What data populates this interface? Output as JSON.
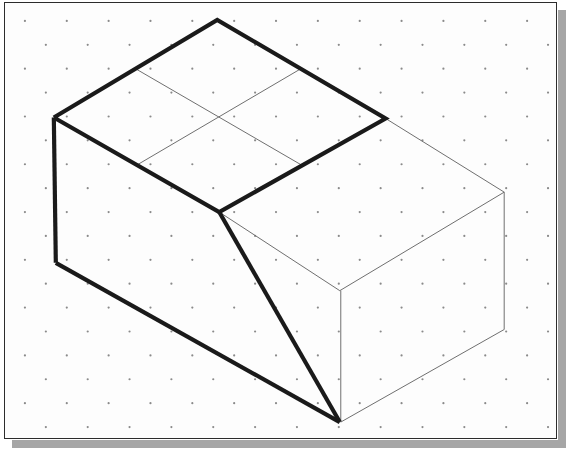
{
  "canvas": {
    "width": 568,
    "height": 454,
    "background_color": "#ffffff"
  },
  "frame": {
    "name": "isometric-sketch-frame",
    "x": 4,
    "y": 2,
    "width": 553,
    "height": 437,
    "fill_color": "#fdfdfd",
    "border_color": "#2c2c2c",
    "border_width": 1
  },
  "shadow": {
    "color": "#a6a6a6",
    "thickness": 8,
    "offset": 10
  },
  "dot_grid": {
    "name": "isometric-dot-grid",
    "dot_color": "#8a8a8a",
    "dot_radius": 1.1,
    "column_spacing": 42,
    "row_spacing": 24,
    "stagger": 21,
    "origin_x": 24,
    "origin_y": 20
  },
  "drawing": {
    "title": "Isometric block with sloped front face",
    "line_colors": {
      "visible_heavy": "#1a1a1a",
      "construction_light": "#6e6e6e"
    },
    "line_widths": {
      "visible_heavy": 4.2,
      "construction_light": 1.0
    },
    "vertices": {
      "top_apex": [
        217,
        19
      ],
      "top_left_corner": [
        53,
        117
      ],
      "top_center": [
        218,
        118
      ],
      "top_right_heavy_corner": [
        386,
        118
      ],
      "slope_top_junction": [
        219,
        212
      ],
      "left_bottom_corner": [
        55,
        263
      ],
      "bottom_front_vertex": [
        340,
        423
      ],
      "far_right_top_corner": [
        505,
        192
      ],
      "far_right_bottom_corner": [
        505,
        330
      ],
      "right_face_front_top": [
        340,
        291
      ],
      "top_edge_mid_left": [
        135,
        68
      ],
      "top_edge_mid_right": [
        301,
        68
      ],
      "bottom_edge_mid_left": [
        136,
        165
      ],
      "bottom_edge_mid_right": [
        302,
        165
      ]
    },
    "heavy_paths": [
      {
        "name": "top-face-outline",
        "points": [
          [
            53,
            117
          ],
          [
            217,
            19
          ],
          [
            386,
            118
          ],
          [
            219,
            212
          ],
          [
            53,
            117
          ]
        ]
      },
      {
        "name": "left-vertical-edge",
        "points": [
          [
            53,
            117
          ],
          [
            55,
            263
          ]
        ]
      },
      {
        "name": "left-face-slope-edge",
        "points": [
          [
            55,
            263
          ],
          [
            340,
            423
          ]
        ]
      },
      {
        "name": "front-slope-edge",
        "points": [
          [
            219,
            212
          ],
          [
            340,
            423
          ]
        ]
      }
    ],
    "light_paths": [
      {
        "name": "top-face-grid-line-a",
        "points": [
          [
            135,
            68
          ],
          [
            302,
            165
          ]
        ]
      },
      {
        "name": "top-face-grid-line-b",
        "points": [
          [
            136,
            165
          ],
          [
            301,
            68
          ]
        ]
      },
      {
        "name": "right-face-top-edge",
        "points": [
          [
            386,
            118
          ],
          [
            505,
            192
          ]
        ]
      },
      {
        "name": "right-face-front-diagonal",
        "points": [
          [
            219,
            212
          ],
          [
            340,
            291
          ]
        ]
      },
      {
        "name": "right-face-upper-diagonal",
        "points": [
          [
            340,
            291
          ],
          [
            505,
            192
          ]
        ]
      },
      {
        "name": "right-face-far-vertical",
        "points": [
          [
            505,
            192
          ],
          [
            505,
            330
          ]
        ]
      },
      {
        "name": "right-face-front-vertical",
        "points": [
          [
            341,
            291
          ],
          [
            341,
            423
          ]
        ]
      },
      {
        "name": "right-face-bottom-edge",
        "points": [
          [
            341,
            423
          ],
          [
            505,
            330
          ]
        ]
      }
    ]
  }
}
